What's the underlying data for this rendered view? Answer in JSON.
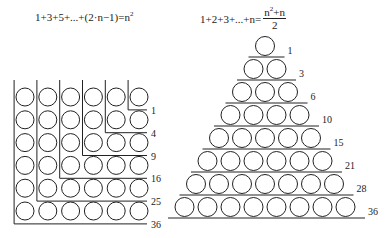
{
  "formulas": {
    "left": {
      "lhs": "1+3+5+...+(2·n−1)=n",
      "exp": "2"
    },
    "right": {
      "lhs": "1+2+3+...+n=",
      "num_base": "n",
      "num_exp": "2",
      "num_tail": "+n",
      "den": "2"
    }
  },
  "left_diagram": {
    "title": "Sum of odd numbers as nested L-shapes (square numbers)",
    "grid_size": 6,
    "labels": [
      "1",
      "4",
      "9",
      "16",
      "25",
      "36"
    ]
  },
  "right_diagram": {
    "title": "Sum of consecutive integers as a triangle (triangular numbers)",
    "rows": 8,
    "labels": [
      "1",
      "3",
      "6",
      "10",
      "15",
      "21",
      "28",
      "36"
    ]
  },
  "colors": {
    "stroke": "#222222",
    "background": "#ffffff"
  }
}
